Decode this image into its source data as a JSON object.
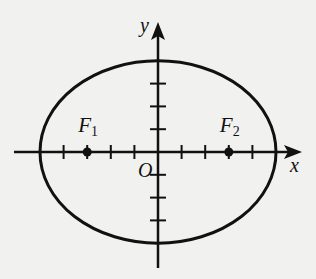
{
  "figure": {
    "type": "ellipse-with-foci",
    "axes": {
      "x_label": "x",
      "y_label": "y",
      "origin_label": "O",
      "x_ticks": [
        -5,
        -4,
        -3,
        -2,
        -1,
        1,
        2,
        3,
        4,
        5
      ],
      "y_ticks": [
        -4,
        -3,
        -2,
        -1,
        1,
        2,
        3,
        4
      ]
    },
    "ellipse": {
      "semi_major_a": 5,
      "semi_minor_b": 4,
      "center": [
        0,
        0
      ]
    },
    "foci": [
      {
        "name": "F",
        "subscript": "1",
        "x": -3,
        "y": 0
      },
      {
        "name": "F",
        "subscript": "2",
        "x": 3,
        "y": 0
      }
    ],
    "colors": {
      "stroke": "#111111",
      "background": "#f1f1ef"
    }
  }
}
